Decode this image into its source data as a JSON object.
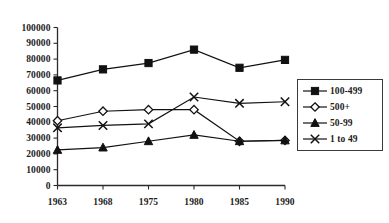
{
  "chart_data": {
    "type": "line",
    "title": "",
    "subtitle": "",
    "xlabel": "",
    "ylabel": "",
    "categories": [
      "1963",
      "1968",
      "1975",
      "1980",
      "1985",
      "1990"
    ],
    "x_tick_labels": [
      "1963",
      "1968",
      "1975",
      "1980",
      "1985",
      "1990"
    ],
    "y_tick_labels": [
      "0",
      "10000",
      "20000",
      "30000",
      "40000",
      "50000",
      "60000",
      "70000",
      "80000",
      "90000",
      "100000"
    ],
    "y_tick_values": [
      0,
      10000,
      20000,
      30000,
      40000,
      50000,
      60000,
      70000,
      80000,
      90000,
      100000
    ],
    "ylim": [
      0,
      100000
    ],
    "grid": false,
    "legend_position": "right",
    "series": [
      {
        "name": "100-499",
        "marker": "filled-square",
        "color": "#111111",
        "values": [
          66500,
          73500,
          77500,
          86000,
          74500,
          79500
        ]
      },
      {
        "name": "500+",
        "marker": "open-diamond",
        "color": "#111111",
        "values": [
          41000,
          47000,
          48000,
          48000,
          28000,
          28500
        ]
      },
      {
        "name": "50-99",
        "marker": "filled-triangle",
        "color": "#111111",
        "values": [
          22500,
          24000,
          28000,
          32000,
          28000,
          28500
        ]
      },
      {
        "name": "1 to 49",
        "marker": "cross",
        "color": "#111111",
        "values": [
          36500,
          38000,
          39000,
          56000,
          52000,
          53000
        ]
      }
    ]
  },
  "legend": {
    "items": [
      {
        "label": "100-499",
        "marker": "filled-square-icon"
      },
      {
        "label": "500+",
        "marker": "open-diamond-icon"
      },
      {
        "label": "50-99",
        "marker": "filled-triangle-icon"
      },
      {
        "label": "1 to 49",
        "marker": "cross-icon"
      }
    ]
  }
}
